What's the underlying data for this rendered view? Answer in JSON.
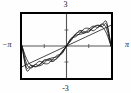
{
  "figure": {
    "labels": {
      "top": "3",
      "bottom": "-3",
      "left": "−π",
      "right": "π"
    },
    "frame_color": "#000000",
    "curve_color": "#1a1a1a",
    "axis_color": "#555555",
    "background": "#fefefe"
  },
  "chart_data": {
    "type": "line",
    "title": "",
    "xlabel": "",
    "ylabel": "",
    "xlim": [
      -3.14159,
      3.14159
    ],
    "ylim": [
      -3,
      3
    ],
    "xticks": [
      -3.14159,
      -1.5708,
      0,
      1.5708,
      3.14159
    ],
    "xticklabels": [
      "-π",
      "",
      "",
      "",
      "π"
    ],
    "yticks": [
      -3,
      -1.5,
      0,
      1.5,
      3
    ],
    "yticklabels": [
      "-3",
      "",
      "",
      "",
      "3"
    ],
    "grid": false,
    "legend": null,
    "series": [
      {
        "name": "partial sum N=2",
        "x": [
          -3.14159,
          -2.82743,
          -2.51327,
          -2.19911,
          -1.88496,
          -1.5708,
          -1.25664,
          -0.94248,
          -0.62832,
          -0.31416,
          0,
          0.31416,
          0.62832,
          0.94248,
          1.25664,
          1.5708,
          1.88496,
          2.19911,
          2.51327,
          2.82743,
          3.14159
        ],
        "y": [
          0,
          -1.18,
          -1.81,
          -1.93,
          -1.71,
          -1.41,
          -1.2,
          -1.1,
          -1.0,
          -0.66,
          0,
          0.66,
          1.0,
          1.1,
          1.2,
          1.41,
          1.71,
          1.93,
          1.81,
          1.18,
          0
        ]
      },
      {
        "name": "partial sum N=3",
        "x": [
          -3.14159,
          -2.82743,
          -2.51327,
          -2.19911,
          -1.88496,
          -1.5708,
          -1.25664,
          -0.94248,
          -0.62832,
          -0.31416,
          0,
          0.31416,
          0.62832,
          0.94248,
          1.25664,
          1.5708,
          1.88496,
          2.19911,
          2.51327,
          2.82743,
          3.14159
        ],
        "y": [
          0,
          -1.62,
          -2.07,
          -1.72,
          -1.43,
          -1.65,
          -1.62,
          -1.18,
          -0.86,
          -0.71,
          0,
          0.71,
          0.86,
          1.18,
          1.62,
          1.65,
          1.43,
          1.72,
          2.07,
          1.62,
          0
        ]
      },
      {
        "name": "partial sum N=5",
        "x": [
          -3.14159,
          -2.82743,
          -2.51327,
          -2.19911,
          -1.88496,
          -1.5708,
          -1.25664,
          -0.94248,
          -0.62832,
          -0.31416,
          0,
          0.31416,
          0.62832,
          0.94248,
          1.25664,
          1.5708,
          1.88496,
          2.19911,
          2.51327,
          2.82743,
          3.14159
        ],
        "y": [
          0,
          -2.02,
          -1.8,
          -1.95,
          -1.76,
          -1.3,
          -1.36,
          -1.45,
          -1.06,
          -0.5,
          0,
          0.5,
          1.06,
          1.45,
          1.36,
          1.3,
          1.76,
          1.95,
          1.8,
          2.02,
          0
        ]
      },
      {
        "name": "partial sum N=8",
        "x": [
          -3.14159,
          -2.82743,
          -2.51327,
          -2.19911,
          -1.88496,
          -1.5708,
          -1.25664,
          -0.94248,
          -0.62832,
          -0.31416,
          0,
          0.31416,
          0.62832,
          0.94248,
          1.25664,
          1.5708,
          1.88496,
          2.19911,
          2.51327,
          2.82743,
          3.14159
        ],
        "y": [
          0,
          -2.25,
          -2.0,
          -1.74,
          -1.86,
          -1.58,
          -1.25,
          -1.32,
          -1.12,
          -0.58,
          0,
          0.58,
          1.12,
          1.32,
          1.25,
          1.58,
          1.86,
          1.74,
          2.0,
          2.25,
          0
        ]
      },
      {
        "name": "limit sawtooth (diagonal)",
        "x": [
          -3.14159,
          0,
          3.14159
        ],
        "y": [
          -1.95,
          0,
          1.95
        ]
      }
    ]
  }
}
